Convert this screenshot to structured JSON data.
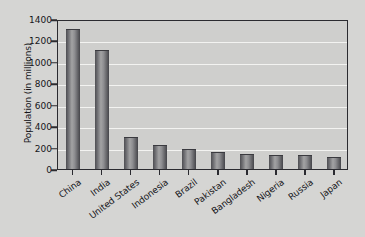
{
  "chart_data": {
    "type": "bar",
    "title": "",
    "xlabel": "",
    "ylabel": "Population (in millions)",
    "categories": [
      "China",
      "India",
      "United States",
      "Indonesia",
      "Brazil",
      "Pakistan",
      "Bangladesh",
      "Nigeria",
      "Russia",
      "Japan"
    ],
    "values": [
      1300,
      1100,
      285,
      215,
      175,
      150,
      130,
      125,
      120,
      100
    ],
    "ylim": [
      0,
      1400
    ],
    "ytick_labels": [
      "0",
      "200",
      "400",
      "600",
      "800",
      "1000",
      "1200",
      "1400"
    ],
    "ytick_values": [
      0,
      200,
      400,
      600,
      800,
      1000,
      1200,
      1400
    ],
    "grid": "horizontal",
    "legend": "none",
    "colors": {
      "bar_dark": "#4e4e52",
      "bar_light": "#a3a3a4",
      "plot_background": "#cfcfcd",
      "figure_background": "#d5d5d3",
      "gridline": "#f3f3f1",
      "axis": "#2b2b30",
      "text": "#15151a"
    }
  }
}
